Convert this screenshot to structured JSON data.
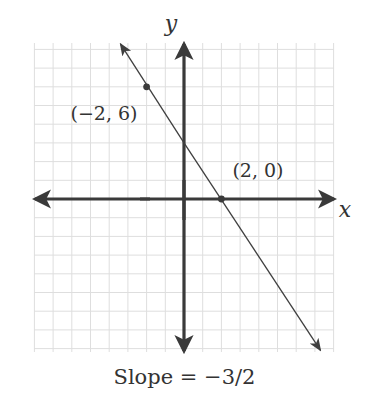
{
  "chart_data": {
    "type": "line",
    "title": "",
    "caption": "Slope = −3/2",
    "xlabel": "x",
    "ylabel": "y",
    "xlim": [
      -8,
      8
    ],
    "ylim": [
      -8,
      8
    ],
    "grid": true,
    "line": {
      "equation": "y = -3/2 x + 3",
      "slope": -1.5,
      "intercept": 3,
      "from": [
        -3.4,
        8.3
      ],
      "to": [
        7.3,
        -8.1
      ]
    },
    "points": [
      {
        "x": -2,
        "y": 6,
        "label": "(−2, 6)"
      },
      {
        "x": 2,
        "y": 0,
        "label": "(2, 0)"
      }
    ]
  },
  "labels": {
    "x_axis": "x",
    "y_axis": "y",
    "point_a": "(−2, 6)",
    "point_b": "(2, 0)",
    "caption": "Slope = −3/2"
  },
  "colors": {
    "axis": "#3a3a3a",
    "grid": "#dedede",
    "line": "#3f3f3f",
    "text": "#333333"
  }
}
